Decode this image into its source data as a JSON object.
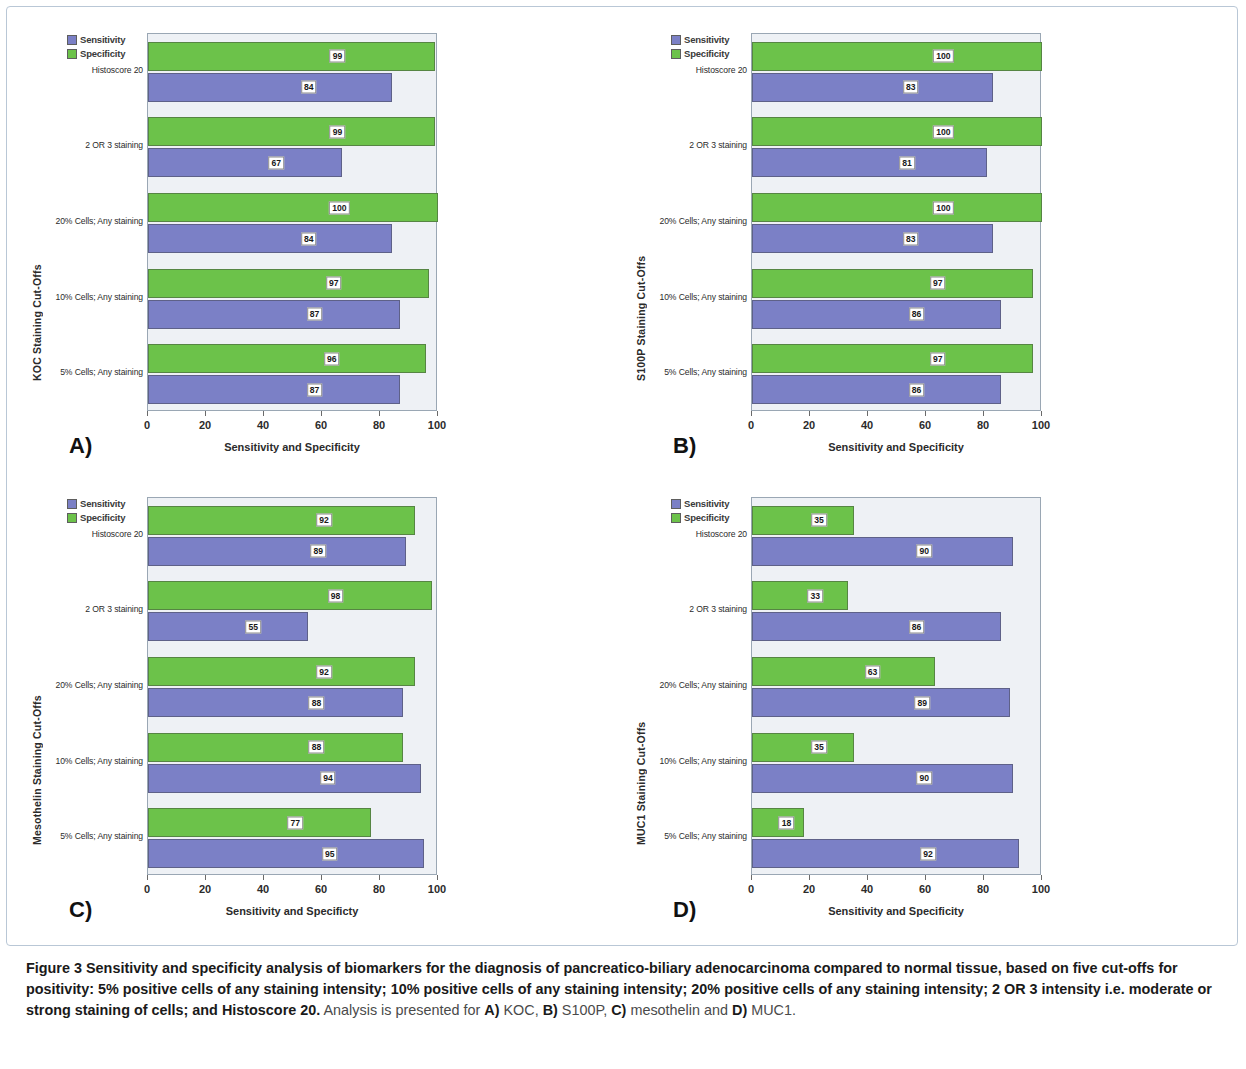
{
  "legend": {
    "sensitivity_label": "Sensitivity",
    "specificity_label": "Specificity",
    "sensitivity_color": "#7b80c6",
    "specificity_color": "#6cc24a"
  },
  "axis": {
    "ticks": [
      "0",
      "20",
      "40",
      "60",
      "80",
      "100"
    ],
    "xlim": [
      0,
      100
    ],
    "categories": [
      "Histoscore 20",
      "2 OR 3 staining",
      "20% Cells; Any staining",
      "10% Cells; Any staining",
      "5% Cells; Any staining"
    ]
  },
  "panels": [
    {
      "letter": "A)",
      "ytitle": "KOC Staining Cut-Offs",
      "xtitle": "Sensitivity and Specificity",
      "sensitivity": [
        84,
        67,
        84,
        87,
        87
      ],
      "specificity": [
        99,
        99,
        100,
        97,
        96
      ]
    },
    {
      "letter": "B)",
      "ytitle": "S100P Staining Cut-Offs",
      "xtitle": "Sensitivity and Specificity",
      "sensitivity": [
        83,
        81,
        83,
        86,
        86
      ],
      "specificity": [
        100,
        100,
        100,
        97,
        97
      ]
    },
    {
      "letter": "C)",
      "ytitle": "Mesothelin Staining Cut-Offs",
      "xtitle": "Sensitivity and Specificty",
      "sensitivity": [
        89,
        55,
        88,
        94,
        95
      ],
      "specificity": [
        92,
        98,
        92,
        88,
        77
      ]
    },
    {
      "letter": "D)",
      "ytitle": "MUC1 Staining Cut-Offs",
      "xtitle": "Sensitivity and Specificity",
      "sensitivity": [
        90,
        86,
        89,
        90,
        92
      ],
      "specificity": [
        35,
        33,
        63,
        35,
        18
      ]
    }
  ],
  "caption": {
    "figure_label": "Figure 3",
    "bold_text": "Sensitivity and specificity analysis of biomarkers for the diagnosis of pancreatico-biliary adenocarcinoma compared to normal tissue, based on five cut-offs for positivity: 5% positive cells of any staining intensity; 10% positive cells of any staining intensity; 20% positive cells of any staining intensity; 2 OR 3 intensity i.e. moderate or strong staining of cells; and Histoscore 20.",
    "tail_prefix": "Analysis is presented for ",
    "tail_a_letter": "A)",
    "tail_a_name": " KOC, ",
    "tail_b_letter": "B)",
    "tail_b_name": " S100P, ",
    "tail_c_letter": "C)",
    "tail_c_name": " mesothelin and ",
    "tail_d_letter": "D)",
    "tail_d_name": " MUC1."
  },
  "chart_data": {
    "type": "bar",
    "title": "Sensitivity and specificity analysis of biomarkers for the diagnosis of pancreatico-biliary adenocarcinoma",
    "orientation": "horizontal",
    "xlabel": "Sensitivity and Specificity",
    "ylabel": "Staining Cut-Offs",
    "xlim": [
      0,
      100
    ],
    "xticks": [
      0,
      20,
      40,
      60,
      80,
      100
    ],
    "grid": false,
    "legend_position": "top-left",
    "categories": [
      "Histoscore 20",
      "2 OR 3 staining",
      "20% Cells; Any staining",
      "10% Cells; Any staining",
      "5% Cells; Any staining"
    ],
    "panels": [
      {
        "panel": "A",
        "marker": "KOC",
        "ylabel": "KOC Staining Cut-Offs",
        "series": [
          {
            "name": "Sensitivity",
            "values": [
              84,
              67,
              84,
              87,
              87
            ],
            "color": "#7b80c6"
          },
          {
            "name": "Specificity",
            "values": [
              99,
              99,
              100,
              97,
              96
            ],
            "color": "#6cc24a"
          }
        ]
      },
      {
        "panel": "B",
        "marker": "S100P",
        "ylabel": "S100P Staining Cut-Offs",
        "series": [
          {
            "name": "Sensitivity",
            "values": [
              83,
              81,
              83,
              86,
              86
            ],
            "color": "#7b80c6"
          },
          {
            "name": "Specificity",
            "values": [
              100,
              100,
              100,
              97,
              97
            ],
            "color": "#6cc24a"
          }
        ]
      },
      {
        "panel": "C",
        "marker": "mesothelin",
        "ylabel": "Mesothelin Staining Cut-Offs",
        "series": [
          {
            "name": "Sensitivity",
            "values": [
              89,
              55,
              88,
              94,
              95
            ],
            "color": "#7b80c6"
          },
          {
            "name": "Specificity",
            "values": [
              92,
              98,
              92,
              88,
              77
            ],
            "color": "#6cc24a"
          }
        ]
      },
      {
        "panel": "D",
        "marker": "MUC1",
        "ylabel": "MUC1 Staining Cut-Offs",
        "series": [
          {
            "name": "Sensitivity",
            "values": [
              90,
              86,
              89,
              90,
              92
            ],
            "color": "#7b80c6"
          },
          {
            "name": "Specificity",
            "values": [
              35,
              33,
              63,
              35,
              18
            ],
            "color": "#6cc24a"
          }
        ]
      }
    ]
  }
}
